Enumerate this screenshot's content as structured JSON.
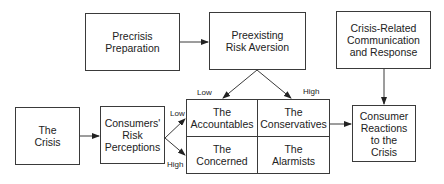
{
  "diagram": {
    "nodes": {
      "precrisis": {
        "lines": [
          "Precrisis",
          "Preparation"
        ]
      },
      "preexisting": {
        "lines": [
          "Preexisting",
          "Risk Aversion"
        ]
      },
      "crisis_comm": {
        "lines": [
          "Crisis-Related",
          "Communication",
          "and Response"
        ]
      },
      "the_crisis": {
        "lines": [
          "The",
          "Crisis"
        ]
      },
      "risk_perceptions": {
        "lines": [
          "Consumers'",
          "Risk",
          "Perceptions"
        ]
      },
      "reactions": {
        "lines": [
          "Consumer",
          "Reactions",
          "to the",
          "Crisis"
        ]
      }
    },
    "matrix": {
      "accountables": {
        "lines": [
          "The",
          "Accountables"
        ]
      },
      "conservatives": {
        "lines": [
          "The",
          "Conservatives"
        ]
      },
      "concerned": {
        "lines": [
          "The",
          "Concerned"
        ]
      },
      "alarmists": {
        "lines": [
          "The",
          "Alarmists"
        ]
      }
    },
    "labels": {
      "aversion_low": "Low",
      "aversion_high": "High",
      "perception_low": "Low",
      "perception_high": "High"
    },
    "colors": {
      "stroke": "#3a3a3a",
      "text": "#222222",
      "background": "#ffffff"
    }
  }
}
